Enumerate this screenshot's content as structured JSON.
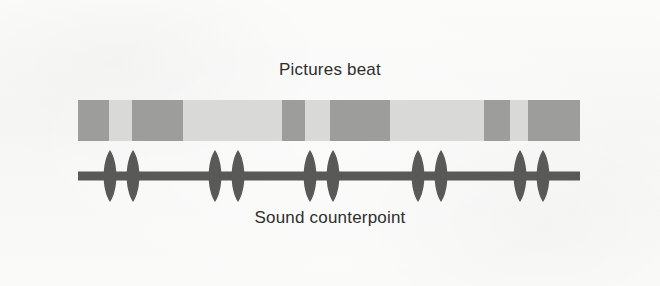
{
  "figure": {
    "top_caption": "Pictures beat",
    "bottom_caption": "Sound counterpoint",
    "background_color": "#f8f8f7",
    "track_light_color": "#d9d9d7",
    "track_dark_color": "#9d9d9b",
    "waveform_color": "#595957"
  },
  "chart_data": {
    "type": "diagram",
    "tracks": [
      {
        "name": "Pictures beat",
        "label": "Pictures beat",
        "label_position": "above",
        "render": "segmented-bar",
        "x_start": 78,
        "x_end": 580,
        "y_top": 100,
        "y_bottom": 141,
        "light_color": "#d9d9d7",
        "dark_color": "#9d9d9b",
        "dark_segments": [
          {
            "index": 1,
            "x": 0,
            "width": 31
          },
          {
            "index": 2,
            "x": 54,
            "width": 51
          },
          {
            "index": 3,
            "x": 204,
            "width": 23
          },
          {
            "index": 4,
            "x": 252,
            "width": 60
          },
          {
            "index": 5,
            "x": 406,
            "width": 26
          },
          {
            "index": 6,
            "x": 450,
            "width": 52
          }
        ]
      },
      {
        "name": "Sound counterpoint",
        "label": "Sound counterpoint",
        "label_position": "below",
        "render": "pulse-line",
        "x_start": 78,
        "x_end": 580,
        "baseline_y": 176,
        "line_thickness": 9,
        "color": "#595957",
        "pulse_pairs": [
          {
            "index": 1,
            "center_x": 32,
            "gap": 23
          },
          {
            "index": 2,
            "center_x": 137,
            "gap": 23
          },
          {
            "index": 3,
            "center_x": 232,
            "gap": 23
          },
          {
            "index": 4,
            "center_x": 340,
            "gap": 23
          },
          {
            "index": 5,
            "center_x": 442,
            "gap": 23
          }
        ],
        "pulse_height": 52,
        "pulse_width": 17
      }
    ],
    "axis_labels": {
      "x": "",
      "y": ""
    },
    "legend": [],
    "grid": false
  }
}
